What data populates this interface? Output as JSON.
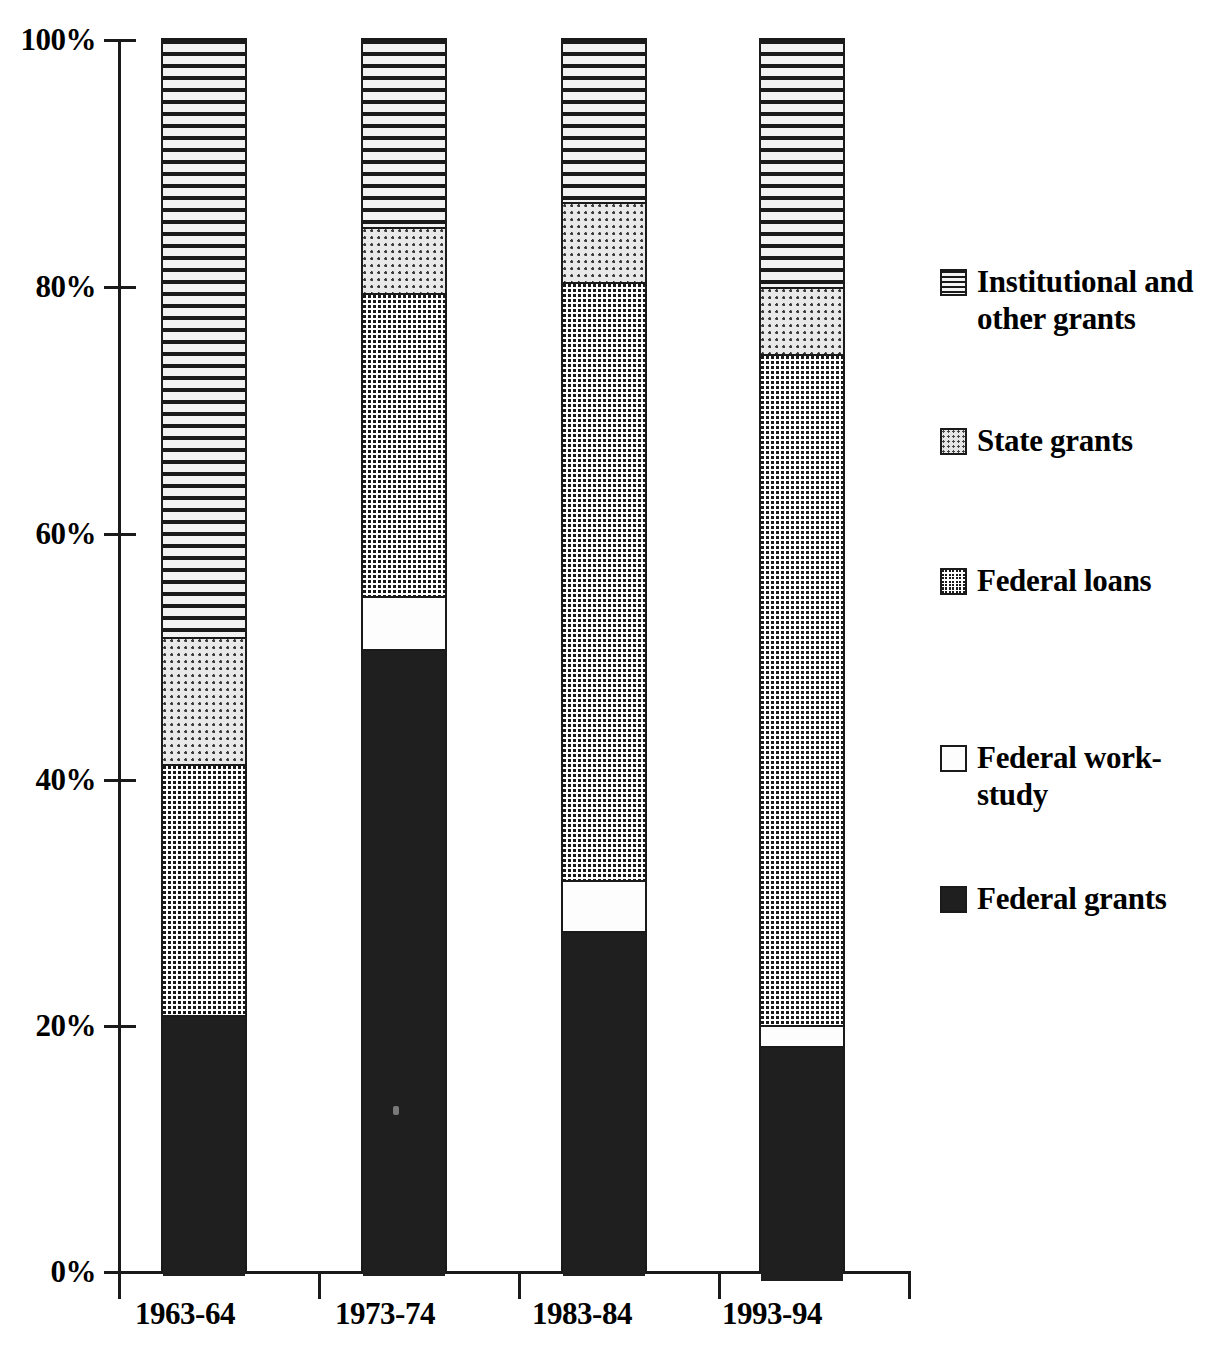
{
  "chart_data": {
    "type": "bar",
    "subtype": "stacked-100-percent",
    "title": "",
    "xlabel": "",
    "ylabel": "",
    "ylim": [
      0,
      100
    ],
    "yticks": [
      "0%",
      "20%",
      "40%",
      "60%",
      "80%",
      "100%"
    ],
    "ytick_values": [
      0,
      20,
      40,
      60,
      80,
      100
    ],
    "grid": false,
    "legend_position": "right",
    "categories": [
      "1963-64",
      "1973-74",
      "1983-84",
      "1993-94"
    ],
    "series": [
      {
        "name": "Federal grants",
        "pattern": "solid-black",
        "values": [
          21.1,
          50.7,
          27.9,
          19.0
        ]
      },
      {
        "name": "Federal work-study",
        "pattern": "white-empty",
        "values": [
          0.0,
          4.3,
          4.1,
          1.7
        ]
      },
      {
        "name": "Federal loans",
        "pattern": "dark-grid",
        "values": [
          20.3,
          24.5,
          48.4,
          54.3
        ]
      },
      {
        "name": "State grants",
        "pattern": "light-dots",
        "values": [
          10.3,
          5.4,
          6.5,
          5.4
        ]
      },
      {
        "name": "Institutional and other grants",
        "pattern": "horizontal-lines",
        "values": [
          48.3,
          15.1,
          13.1,
          20.0
        ]
      }
    ],
    "cumulative_tops": {
      "1963-64": [
        21.1,
        21.1,
        41.4,
        51.7,
        100.0
      ],
      "1973-74": [
        50.7,
        55.0,
        79.5,
        84.9,
        100.0
      ],
      "1983-84": [
        27.9,
        32.0,
        80.4,
        86.9,
        100.0
      ],
      "1993-94": [
        19.0,
        20.7,
        75.0,
        80.4,
        100.0
      ]
    }
  },
  "axis": {
    "y_tick_labels": [
      "100%",
      "80%",
      "60%",
      "40%",
      "20%",
      "0%"
    ],
    "x_tick_labels": [
      "1963-64",
      "1973-74",
      "1983-84",
      "1993-94"
    ]
  },
  "legend": {
    "items": [
      {
        "label": "Institutional and other grants",
        "swatch": "horizontal-lines-swatch"
      },
      {
        "label": "State grants",
        "swatch": "light-dots-swatch"
      },
      {
        "label": "Federal loans",
        "swatch": "dark-grid-swatch"
      },
      {
        "label": "Federal work-study",
        "swatch": "white-empty-swatch"
      },
      {
        "label": "Federal grants",
        "swatch": "solid-black-swatch"
      }
    ]
  },
  "colors": {
    "ink": "#1a1a1a",
    "paper": "#ffffff",
    "light_fill": "#e9e9e9"
  }
}
